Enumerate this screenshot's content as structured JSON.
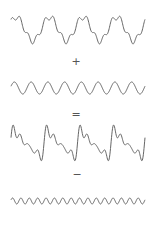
{
  "stroke_color": "#666666",
  "rows": [
    {
      "id": "complex-wave-1",
      "description": "slow wave with superimposed high-frequency ripple",
      "cycles": 4,
      "ripple_cycles": 16,
      "y_center": 29,
      "amplitude": 12,
      "ripple_amplitude": 3
    },
    {
      "id": "sine-wave",
      "description": "pure sine wave",
      "cycles": 8,
      "y_center": 88,
      "amplitude": 6
    },
    {
      "id": "complex-wave-2",
      "description": "sawtooth-like composite wave",
      "cycles": 4,
      "y_center": 144,
      "amplitude": 14
    },
    {
      "id": "fast-sine-wave",
      "description": "high-frequency sine wave",
      "cycles": 16,
      "y_center": 201,
      "amplitude": 3
    }
  ],
  "operators": {
    "plus": "+",
    "equals": "=",
    "minus": "−"
  }
}
